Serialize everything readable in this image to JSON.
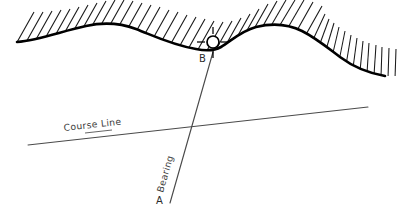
{
  "diagram": {
    "background_color": "#ffffff",
    "ink_color": "#000000",
    "line_color": "#4a4a4a",
    "labels": {
      "course_line": "Course Line",
      "bearing": "Bearing",
      "point_a": "A",
      "point_b": "B"
    },
    "elements": {
      "coastline_name": "coastline-shoreline",
      "hatching_name": "land-hatching",
      "landmark_name": "landmark-marker",
      "course_line_name": "course-line",
      "bearing_line_name": "bearing-line"
    },
    "geometry": {
      "coastline_path": "M 17,42 C 40,40 62,31 86,26 C 104,22 120,23 136,29 C 154,36 172,45 196,49 C 206,51 214,51 221,47 C 231,41 241,31 256,27 C 272,23 288,24 302,31 C 316,38 328,48 340,57 C 352,66 368,73 385,76",
      "course_line_start": [
        28,
        145
      ],
      "course_line_end": [
        368,
        107
      ],
      "bearing_line_start": [
        170,
        203
      ],
      "bearing_line_end": [
        213,
        52
      ],
      "intersection": [
        190,
        127
      ],
      "landmark_center": [
        213,
        42
      ],
      "landmark_radius": 6,
      "bearing_angle_deg": -74.1,
      "course_angle_deg": -6.4
    }
  }
}
